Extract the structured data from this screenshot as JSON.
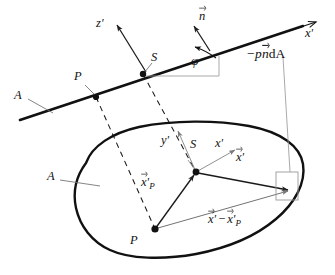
{
  "figure": {
    "background_color": "#ffffff",
    "ink_color": "#111111",
    "thin_line_color": "#888888",
    "width": 335,
    "height": 275
  },
  "labels": {
    "plane_axis_z": "z",
    "plane_axis_z_prime": "′",
    "normal_vector": "n",
    "plane_axis_x": "x",
    "plane_axis_x_prime": "′",
    "pressure_force": "−p",
    "pressure_force_n": "n",
    "pressure_force_dA": "dA",
    "angle_phi": "φ",
    "point_S_upper": "S",
    "point_P_upper": "P",
    "surface_A_upper": "A",
    "surface_A_lower": "A",
    "body_axis_y": "y",
    "body_axis_y_prime": "′",
    "point_S_lower": "S",
    "body_axis_x": "x",
    "body_axis_x_prime": "′",
    "point_P_lower": "P",
    "vector_xP": "x",
    "vector_xP_prime": "′",
    "vector_xP_sub": "P",
    "vector_x": "x",
    "vector_x_prime": "′",
    "vector_diff_x": "x",
    "vector_diff_prime1": "′",
    "vector_diff_minus": "−",
    "vector_diff_xP": "x",
    "vector_diff_prime2": "′",
    "vector_diff_sub": "P"
  },
  "geometry": {
    "inclined_line": {
      "x1": 20,
      "y1": 120,
      "x2": 316,
      "y2": 22,
      "label": "cutting-plane-trace"
    },
    "point_P_upper": {
      "x": 96,
      "y": 97
    },
    "point_S_upper": {
      "x": 143,
      "y": 74
    },
    "point_P_lower": {
      "x": 155,
      "y": 229
    },
    "point_S_lower": {
      "x": 196,
      "y": 172
    },
    "area_element_square": {
      "x": 276,
      "y": 172,
      "w": 22,
      "h": 28
    },
    "angle_phi_degrees": 18,
    "normal_vector_tip": {
      "x": 196,
      "y": 28
    },
    "z_axis_tip": {
      "x": 117,
      "y": 25
    }
  }
}
